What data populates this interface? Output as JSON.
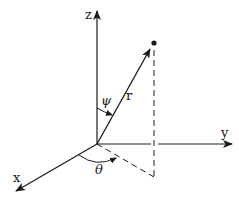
{
  "diagram": {
    "type": "spherical-coordinates",
    "axes": {
      "x": {
        "label": "x"
      },
      "y": {
        "label": "y"
      },
      "z": {
        "label": "z"
      }
    },
    "vector": {
      "label": "r"
    },
    "angles": {
      "polar": {
        "label": "ψ"
      },
      "azimuth": {
        "label": "θ"
      }
    },
    "colors": {
      "stroke": "#1a1a1a",
      "background": "#ffffff"
    }
  }
}
